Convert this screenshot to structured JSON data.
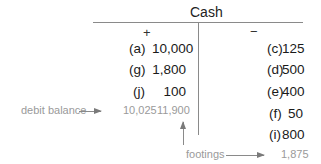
{
  "account": {
    "title": "Cash",
    "debit_sign": "+",
    "credit_sign": "−"
  },
  "debits": [
    {
      "label": "(a)",
      "amount": "10,000"
    },
    {
      "label": "(g)",
      "amount": "1,800"
    },
    {
      "label": "(j)",
      "amount": "100"
    }
  ],
  "credits": [
    {
      "label": "(c)",
      "amount": "125"
    },
    {
      "label": "(d)",
      "amount": "500"
    },
    {
      "label": "(e)",
      "amount": "400"
    },
    {
      "label": "(f)",
      "amount": "50"
    },
    {
      "label": "(i)",
      "amount": "800"
    }
  ],
  "annotations": {
    "debit_balance_label": "debit balance",
    "debit_balance_value": "10,025",
    "debit_footing": "11,900",
    "footings_label": "footings",
    "credit_footing": "1,875"
  },
  "colors": {
    "line": "#8a8a8a",
    "annotation_text": "#9a9a9a",
    "entry_text": "#1a1a1a"
  }
}
